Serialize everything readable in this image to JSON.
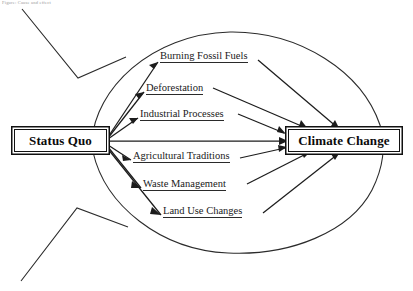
{
  "diagram": {
    "type": "fishbone-cause-and-effect",
    "title_note": "Figure: Cause and effect",
    "source_node": {
      "label": "Status Quo",
      "name": "status-quo"
    },
    "effect_node": {
      "label": "Climate Change",
      "name": "climate-change"
    },
    "causes": [
      {
        "label": "Burning Fossil Fuels"
      },
      {
        "label": "Deforestation"
      },
      {
        "label": "Industrial Processes"
      },
      {
        "label": "Agricultural Traditions"
      },
      {
        "label": "Waste Management"
      },
      {
        "label": "Land Use Changes"
      }
    ],
    "colors": {
      "line": "#2b2b2b",
      "arrow": "#1c1c1c",
      "box_border": "#111111",
      "text": "#0b0b0b",
      "background": "#ffffff"
    },
    "shapes": {
      "body_outline": "ellipse",
      "tail": "fish-tail-left",
      "arrow_direction": "left-to-right-converging"
    }
  }
}
